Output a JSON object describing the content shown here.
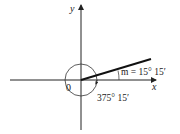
{
  "diagram": {
    "type": "angle-standard-position",
    "axes": {
      "x_label": "x",
      "y_label": "y",
      "origin_label": "0"
    },
    "reference_angle_label": "m = 15° 15′",
    "angle_label": "375° 15′",
    "colors": {
      "stroke": "#222222",
      "background": "#ffffff"
    }
  }
}
